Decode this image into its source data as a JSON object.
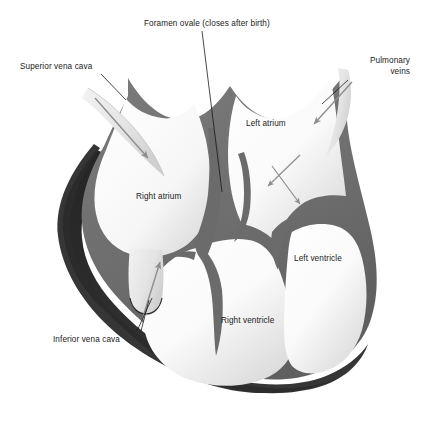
{
  "figure": {
    "background_color": "#ffffff"
  },
  "labels": {
    "foramen_ovale": "Foramen ovale (closes after birth)",
    "superior_vena_cava": "Superior vena cava",
    "pulmonary_veins_line1": "Pulmonary",
    "pulmonary_veins_line2": "veins",
    "left_atrium": "Left atrium",
    "right_atrium": "Right atrium",
    "left_ventricle": "Left ventricle",
    "right_ventricle": "Right ventricle",
    "inferior_vena_cava": "Inferior vena cava"
  },
  "colors": {
    "text": "#1b1b1b",
    "leader_line": "#1b1b1b",
    "flow_arrow": "#8e8e8e",
    "myocardium_wall": "#6f6f6f",
    "wall_dark_edge": "#5a5a5a",
    "outer_shadow": "#2f2f2f",
    "chamber_light": "#fdfdfd",
    "chamber_shade": "#d8d8d8",
    "vessel_tube": "#e6e6e6",
    "background": "#ffffff"
  },
  "structures": [
    "superior vena cava",
    "inferior vena cava",
    "pulmonary veins",
    "right atrium",
    "left atrium",
    "right ventricle",
    "left ventricle",
    "foramen ovale",
    "interventricular septum",
    "atrioventricular valves"
  ],
  "flow_arrows": [
    {
      "name": "svc-inflow-arrow",
      "description": "blood entering right atrium from superior vena cava"
    },
    {
      "name": "ivc-inflow-arrow",
      "description": "blood entering right atrium from inferior vena cava"
    },
    {
      "name": "pulmonary-inflow-arrow",
      "description": "blood entering left atrium from pulmonary veins"
    },
    {
      "name": "left-atrium-branch-arrow",
      "description": "blood dividing within left atrium"
    }
  ]
}
